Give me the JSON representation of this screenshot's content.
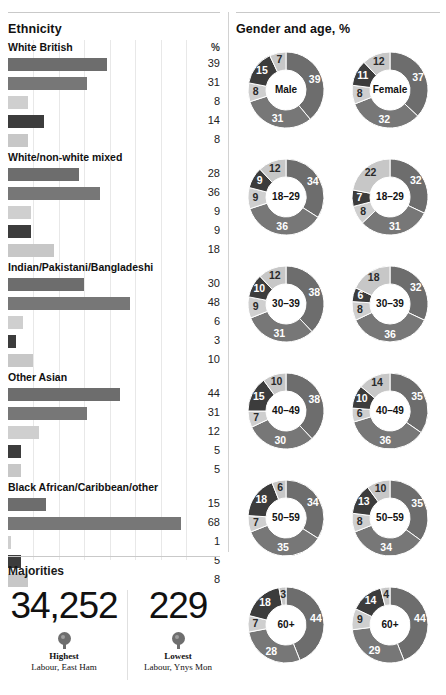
{
  "meta": {
    "percent_symbol": "%"
  },
  "palette": {
    "series": [
      "#6d6d6d",
      "#777777",
      "#cfcfcf",
      "#3c3c3c",
      "#c7c7c7"
    ],
    "bar_conservative": "#6d6d6d",
    "bar_labour": "#777777",
    "bar_libdem": "#cfcfcf",
    "bar_ukip": "#3c3c3c",
    "bar_other": "#c7c7c7",
    "grid": "#e8e8e8",
    "rule": "#c9c9c9",
    "text": "#1a1a1a"
  },
  "ethnicity": {
    "heading": "Ethnicity",
    "pct_header": "%",
    "axis_max": 70,
    "groups": [
      {
        "label": "White British",
        "values": [
          39,
          31,
          8,
          14,
          8
        ]
      },
      {
        "label": "White/non-white mixed",
        "values": [
          28,
          36,
          9,
          9,
          18
        ]
      },
      {
        "label": "Indian/Pakistani/Bangladeshi",
        "values": [
          30,
          48,
          6,
          3,
          10
        ]
      },
      {
        "label": "Other Asian",
        "values": [
          44,
          31,
          12,
          5,
          5
        ]
      },
      {
        "label": "Black African/Caribbean/other",
        "values": [
          15,
          68,
          1,
          5,
          8
        ]
      }
    ]
  },
  "gender_age": {
    "heading": "Gender and age, %",
    "rows": [
      {
        "male": {
          "center": "Male",
          "values": [
            39,
            31,
            8,
            15,
            7
          ]
        },
        "female": {
          "center": "Female",
          "values": [
            37,
            32,
            8,
            11,
            12
          ]
        }
      },
      {
        "male": {
          "center": "18–29",
          "values": [
            34,
            36,
            9,
            9,
            12
          ]
        },
        "female": {
          "center": "18–29",
          "values": [
            32,
            31,
            8,
            7,
            22
          ]
        }
      },
      {
        "male": {
          "center": "30–39",
          "values": [
            38,
            31,
            9,
            10,
            12
          ]
        },
        "female": {
          "center": "30–39",
          "values": [
            32,
            36,
            8,
            6,
            18
          ]
        }
      },
      {
        "male": {
          "center": "40–49",
          "values": [
            38,
            30,
            7,
            15,
            10
          ]
        },
        "female": {
          "center": "40–49",
          "values": [
            35,
            36,
            6,
            10,
            14
          ]
        }
      },
      {
        "male": {
          "center": "50–59",
          "values": [
            34,
            35,
            7,
            18,
            6
          ]
        },
        "female": {
          "center": "50–59",
          "values": [
            35,
            34,
            8,
            13,
            10
          ]
        }
      },
      {
        "male": {
          "center": "60+",
          "values": [
            44,
            28,
            7,
            18,
            3
          ]
        },
        "female": {
          "center": "60+",
          "values": [
            44,
            29,
            9,
            14,
            4
          ]
        }
      }
    ]
  },
  "majorities": {
    "heading": "Majorities",
    "items": [
      {
        "number": "34,252",
        "label": "Highest",
        "sub": "Labour, East Ham",
        "pin": "map-pin-icon"
      },
      {
        "number": "229",
        "label": "Lowest",
        "sub": "Labour, Ynys Mon",
        "pin": "map-pin-icon"
      }
    ]
  },
  "chart_data": [
    {
      "type": "bar",
      "title": "Ethnicity",
      "orientation": "horizontal",
      "xlabel": "%",
      "ylabel": "",
      "xlim": [
        0,
        70
      ],
      "grid": true,
      "categories": [
        "White British",
        "White/non-white mixed",
        "Indian/Pakistani/Bangladeshi",
        "Other Asian",
        "Black African/Caribbean/other"
      ],
      "series": [
        {
          "name": "series-1",
          "values": [
            39,
            28,
            30,
            44,
            15
          ],
          "color": "#6d6d6d"
        },
        {
          "name": "series-2",
          "values": [
            31,
            36,
            48,
            31,
            68
          ],
          "color": "#777777"
        },
        {
          "name": "series-3",
          "values": [
            8,
            9,
            6,
            12,
            1
          ],
          "color": "#cfcfcf"
        },
        {
          "name": "series-4",
          "values": [
            14,
            9,
            3,
            5,
            5
          ],
          "color": "#3c3c3c"
        },
        {
          "name": "series-5",
          "values": [
            8,
            18,
            10,
            5,
            8
          ],
          "color": "#c7c7c7"
        }
      ]
    },
    {
      "type": "pie",
      "title": "Gender and age, %",
      "note": "Twelve donut charts; each slice order is clockwise from 12 o'clock.",
      "donuts": [
        {
          "label": "Male",
          "values": [
            39,
            31,
            8,
            15,
            7
          ]
        },
        {
          "label": "Female",
          "values": [
            37,
            32,
            8,
            11,
            12
          ]
        },
        {
          "label": "18–29 male",
          "values": [
            34,
            36,
            9,
            9,
            12
          ]
        },
        {
          "label": "18–29 female",
          "values": [
            32,
            31,
            8,
            7,
            22
          ]
        },
        {
          "label": "30–39 male",
          "values": [
            38,
            31,
            9,
            10,
            12
          ]
        },
        {
          "label": "30–39 female",
          "values": [
            32,
            36,
            8,
            6,
            18
          ]
        },
        {
          "label": "40–49 male",
          "values": [
            38,
            30,
            7,
            15,
            10
          ]
        },
        {
          "label": "40–49 female",
          "values": [
            35,
            36,
            6,
            10,
            14
          ]
        },
        {
          "label": "50–59 male",
          "values": [
            34,
            35,
            7,
            18,
            6
          ]
        },
        {
          "label": "50–59 female",
          "values": [
            35,
            34,
            8,
            13,
            10
          ]
        },
        {
          "label": "60+ male",
          "values": [
            44,
            28,
            7,
            18,
            3
          ]
        },
        {
          "label": "60+ female",
          "values": [
            44,
            29,
            9,
            14,
            4
          ]
        }
      ],
      "slice_colors": [
        "#6d6d6d",
        "#777777",
        "#cfcfcf",
        "#3c3c3c",
        "#c7c7c7"
      ]
    }
  ]
}
